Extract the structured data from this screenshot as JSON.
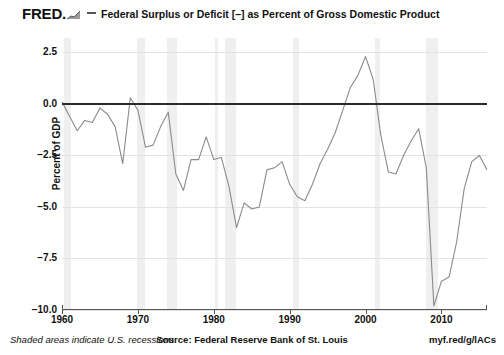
{
  "header": {
    "logo_text": "FRED",
    "logo_suffix": ".",
    "logo_glyph": "rising-chart-icon",
    "title": "Federal Surplus or Deficit [–] as Percent of Gross Domestic Product"
  },
  "footer": {
    "left": "Shaded areas indicate U.S. recessions",
    "center": "Source: Federal Reserve Bank of St. Louis",
    "right": "myf.red/g/lACs"
  },
  "chart_data": {
    "type": "line",
    "title": "Federal Surplus or Deficit [–] as Percent of Gross Domestic Product",
    "xlabel": "",
    "ylabel": "Percent of GDP",
    "xlim": [
      1960,
      2016
    ],
    "ylim": [
      -10.0,
      3.2
    ],
    "yticks": [
      2.5,
      0.0,
      -2.5,
      -5.0,
      -7.5,
      -10.0
    ],
    "ytick_labels": [
      "2.5",
      "0.0",
      "−2.5",
      "−5.0",
      "−7.5",
      "−10.0"
    ],
    "xticks": [
      1960,
      1970,
      1980,
      1990,
      2000,
      2010
    ],
    "xtick_labels": [
      "1960",
      "1970",
      "1980",
      "1990",
      "2000",
      "2010"
    ],
    "grid": true,
    "zero_line": 0.0,
    "legend": null,
    "line_color": "#8a8a8a",
    "zero_line_color": "#2b2b2b",
    "band_color": "#ececec",
    "series": [
      {
        "name": "Federal Surplus or Deficit as Percent of GDP",
        "x": [
          1960,
          1961,
          1962,
          1963,
          1964,
          1965,
          1966,
          1967,
          1968,
          1969,
          1970,
          1971,
          1972,
          1973,
          1974,
          1975,
          1976,
          1977,
          1978,
          1979,
          1980,
          1981,
          1982,
          1983,
          1984,
          1985,
          1986,
          1987,
          1988,
          1989,
          1990,
          1991,
          1992,
          1993,
          1994,
          1995,
          1996,
          1997,
          1998,
          1999,
          2000,
          2001,
          2002,
          2003,
          2004,
          2005,
          2006,
          2007,
          2008,
          2009,
          2010,
          2011,
          2012,
          2013,
          2014,
          2015,
          2016
        ],
        "values": [
          0.1,
          -0.6,
          -1.3,
          -0.8,
          -0.9,
          -0.2,
          -0.5,
          -1.1,
          -2.9,
          0.3,
          -0.3,
          -2.1,
          -2.0,
          -1.1,
          -0.4,
          -3.4,
          -4.2,
          -2.7,
          -2.7,
          -1.6,
          -2.7,
          -2.6,
          -4.0,
          -6.0,
          -4.8,
          -5.1,
          -5.0,
          -3.2,
          -3.1,
          -2.8,
          -3.9,
          -4.5,
          -4.7,
          -3.9,
          -2.9,
          -2.2,
          -1.4,
          -0.3,
          0.8,
          1.4,
          2.3,
          1.2,
          -1.5,
          -3.3,
          -3.4,
          -2.5,
          -1.8,
          -1.2,
          -3.1,
          -9.8,
          -8.6,
          -8.4,
          -6.7,
          -4.1,
          -2.8,
          -2.5,
          -3.2
        ]
      }
    ],
    "recession_bands": [
      {
        "start": 1960.3,
        "end": 1961.2
      },
      {
        "start": 1969.9,
        "end": 1970.9
      },
      {
        "start": 1973.9,
        "end": 1975.2
      },
      {
        "start": 1980.1,
        "end": 1980.5
      },
      {
        "start": 1981.5,
        "end": 1982.9
      },
      {
        "start": 1990.5,
        "end": 1991.2
      },
      {
        "start": 2001.2,
        "end": 2001.9
      },
      {
        "start": 2007.9,
        "end": 2009.5
      }
    ]
  }
}
